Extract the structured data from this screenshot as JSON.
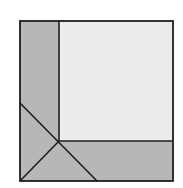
{
  "diagram": {
    "title": "",
    "colors": {
      "background": "#ffffff",
      "shaded": "#b7b7b7",
      "inner_square": "#ebebeb",
      "stroke": "#1e1e1e"
    },
    "outer_square": {
      "x1": 20,
      "y1": 21,
      "x2": 173,
      "y2": 181
    },
    "inner_square": {
      "x1": 59,
      "y1": 21,
      "x2": 173,
      "y2": 141
    },
    "intersection": {
      "x": 59,
      "y": 141
    },
    "diagonal_left_start": {
      "x": 20,
      "y": 103
    },
    "diagonal_bottom_end": {
      "x": 97,
      "y": 181
    },
    "corner_line_end": {
      "x": 20,
      "y": 181
    },
    "regions": [
      {
        "name": "left-strip",
        "shade": "shaded"
      },
      {
        "name": "bottom-strip",
        "shade": "shaded"
      },
      {
        "name": "inner-square",
        "shade": "light"
      },
      {
        "name": "corner-triangle-left",
        "shade": "shaded"
      },
      {
        "name": "corner-triangle-bottom",
        "shade": "shaded"
      }
    ]
  }
}
